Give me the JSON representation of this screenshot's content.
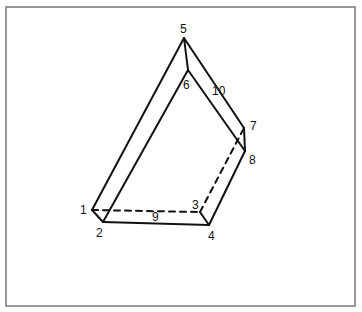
{
  "figure": {
    "type": "polyhedron-wireframe",
    "frame": {
      "x": 6,
      "y": 7,
      "width": 349,
      "height": 299,
      "stroke": "#777777"
    },
    "line_color": "#111111",
    "vertices": [
      {
        "id": "1",
        "label": "1",
        "x": 92,
        "y": 210,
        "label_x": 80,
        "label_y": 214
      },
      {
        "id": "2",
        "label": "2",
        "x": 103,
        "y": 222,
        "label_x": 96,
        "label_y": 237
      },
      {
        "id": "3",
        "label": "3",
        "x": 200,
        "y": 212,
        "label_x": 192,
        "label_y": 209
      },
      {
        "id": "4",
        "label": "4",
        "x": 209,
        "y": 225,
        "label_x": 208,
        "label_y": 240
      },
      {
        "id": "5",
        "label": "5",
        "x": 184,
        "y": 38,
        "label_x": 180,
        "label_y": 33
      },
      {
        "id": "6",
        "label": "6",
        "x": 188,
        "y": 70,
        "label_x": 183,
        "label_y": 89
      },
      {
        "id": "7",
        "label": "7",
        "x": 244,
        "y": 128,
        "label_x": 250,
        "label_y": 130
      },
      {
        "id": "8",
        "label": "8",
        "x": 245,
        "y": 151,
        "label_x": 249,
        "label_y": 164
      }
    ],
    "edges": [
      {
        "id": "e1-5",
        "from": "1",
        "to": "5",
        "style": "solid"
      },
      {
        "id": "e2-6",
        "from": "2",
        "to": "6",
        "style": "solid"
      },
      {
        "id": "e5-6",
        "from": "5",
        "to": "6",
        "style": "solid"
      },
      {
        "id": "e5-7",
        "from": "5",
        "to": "7",
        "style": "solid"
      },
      {
        "id": "e6-8",
        "from": "6",
        "to": "8",
        "style": "solid"
      },
      {
        "id": "e7-8",
        "from": "7",
        "to": "8",
        "style": "solid"
      },
      {
        "id": "e1-2",
        "from": "1",
        "to": "2",
        "style": "solid"
      },
      {
        "id": "e2-4",
        "from": "2",
        "to": "4",
        "style": "solid"
      },
      {
        "id": "e4-8",
        "from": "4",
        "to": "8",
        "style": "solid"
      },
      {
        "id": "e3-4",
        "from": "3",
        "to": "4",
        "style": "solid"
      },
      {
        "id": "e1-3",
        "from": "1",
        "to": "3",
        "style": "dashed"
      },
      {
        "id": "e3-7",
        "from": "3",
        "to": "7",
        "style": "dashed"
      }
    ],
    "face_labels": [
      {
        "id": "9",
        "label": "9",
        "x": 152,
        "y": 221
      },
      {
        "id": "10",
        "label": "10",
        "x": 212,
        "y": 95
      }
    ]
  }
}
